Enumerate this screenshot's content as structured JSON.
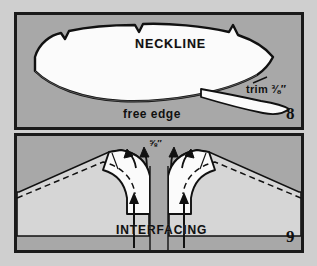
{
  "page": {
    "kind": "sewing-instruction-diagram",
    "background_color": "#cfcfcf",
    "panel_fill": "#a8a8a8",
    "ink_color": "#101010",
    "fabric_color": "#d0d0d0",
    "interfacing_color": "#fbfbfb"
  },
  "panels": [
    {
      "number": "8",
      "labels": {
        "neckline": "NECKLINE",
        "free_edge": "free edge",
        "trim": "trim ⅜″"
      },
      "description_parts": [
        "curved neckline facing piece",
        "clipped notches along upper curved edge",
        "trimmed seam allowance strip"
      ]
    },
    {
      "number": "9",
      "labels": {
        "interfacing": "INTERFACING",
        "seam_allowance": "⅝″"
      },
      "description_parts": [
        "garment front neckline with center opening",
        "interfacing band stitched to neckline",
        "dashed stitching line",
        "arrows pointing to interfacing"
      ]
    }
  ]
}
